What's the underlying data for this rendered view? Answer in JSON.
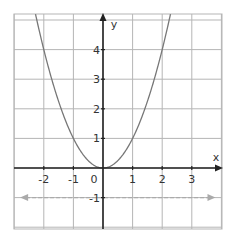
{
  "chart_data": {
    "type": "line",
    "title": "",
    "xlabel": "x",
    "ylabel": "y",
    "xlim": [
      -3,
      4
    ],
    "ylim": [
      -2,
      5.2
    ],
    "grid": true,
    "x_ticks": [
      -2,
      -1,
      0,
      1,
      2,
      3
    ],
    "y_ticks": [
      -1,
      1,
      2,
      3,
      4
    ],
    "x_tick_labels": [
      "-2",
      "-1",
      "0",
      "1",
      "2",
      "3"
    ],
    "y_tick_labels": [
      "-1",
      "1",
      "2",
      "3",
      "4"
    ],
    "series": [
      {
        "name": "y = x^2",
        "style": "solid",
        "color": "#777777",
        "x": [
          -2.3,
          -2,
          -1.5,
          -1,
          -0.5,
          0,
          0.5,
          1,
          1.5,
          2,
          2.3
        ],
        "y": [
          5.29,
          4,
          2.25,
          1,
          0.25,
          0,
          0.25,
          1,
          2.25,
          4,
          5.29
        ]
      },
      {
        "name": "y = -1",
        "style": "dashed",
        "color": "#aaaaaa",
        "arrows": "both",
        "x": [
          -2.8,
          3.8
        ],
        "y": [
          -1,
          -1
        ]
      }
    ]
  },
  "axes": {
    "x_label": "x",
    "y_label": "y",
    "origin_label": "0"
  },
  "colors": {
    "grid": "#b5b5b5",
    "axis": "#222222",
    "curve": "#777777",
    "dashed": "#aaaaaa"
  }
}
